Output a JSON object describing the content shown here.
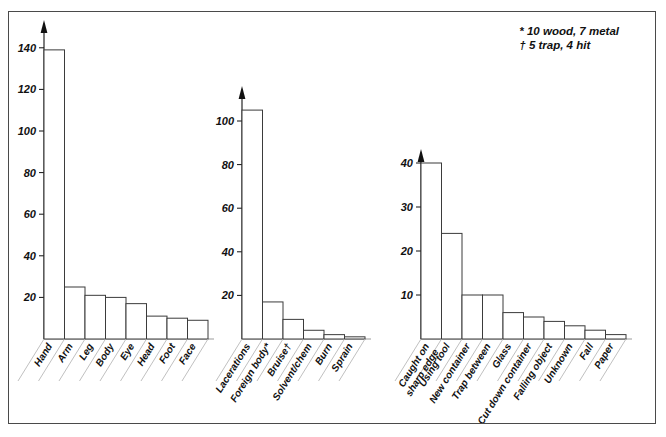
{
  "figure": {
    "clipped_header_text": "",
    "legend_lines": [
      "*  10 wood, 7 metal",
      "† 5 trap, 4 hit"
    ]
  },
  "chart_data": [
    {
      "type": "bar",
      "title": "",
      "xlabel": "",
      "ylabel": "",
      "ylim": [
        0,
        150
      ],
      "yticks": [
        20,
        40,
        60,
        80,
        100,
        120,
        140
      ],
      "grid": false,
      "legend": "none",
      "categories": [
        "Hand",
        "Arm",
        "Leg",
        "Body",
        "Eye",
        "Head",
        "Foot",
        "Face"
      ],
      "values": [
        139,
        25,
        21,
        20,
        17,
        11,
        10,
        9
      ]
    },
    {
      "type": "bar",
      "title": "",
      "xlabel": "",
      "ylabel": "",
      "ylim": [
        0,
        113
      ],
      "yticks": [
        20,
        40,
        60,
        80,
        100
      ],
      "grid": false,
      "legend": "none",
      "categories": [
        "Lacerations",
        "Foreign body*",
        "Bruise†",
        "Solvent/chem",
        "Burn",
        "Sprain"
      ],
      "values": [
        105,
        17,
        9,
        4,
        2,
        1
      ]
    },
    {
      "type": "bar",
      "title": "",
      "xlabel": "",
      "ylabel": "",
      "ylim": [
        0,
        44
      ],
      "yticks": [
        10,
        20,
        30,
        40
      ],
      "grid": false,
      "legend": "none",
      "categories": [
        "Caught on sharp edge",
        "Using tool",
        "New container",
        "Trap between",
        "Glass",
        "Cut down container",
        "Falling object",
        "Unknown",
        "Fall",
        "Paper"
      ],
      "values": [
        40,
        24,
        10,
        10,
        6,
        5,
        4,
        3,
        2,
        1
      ]
    }
  ]
}
